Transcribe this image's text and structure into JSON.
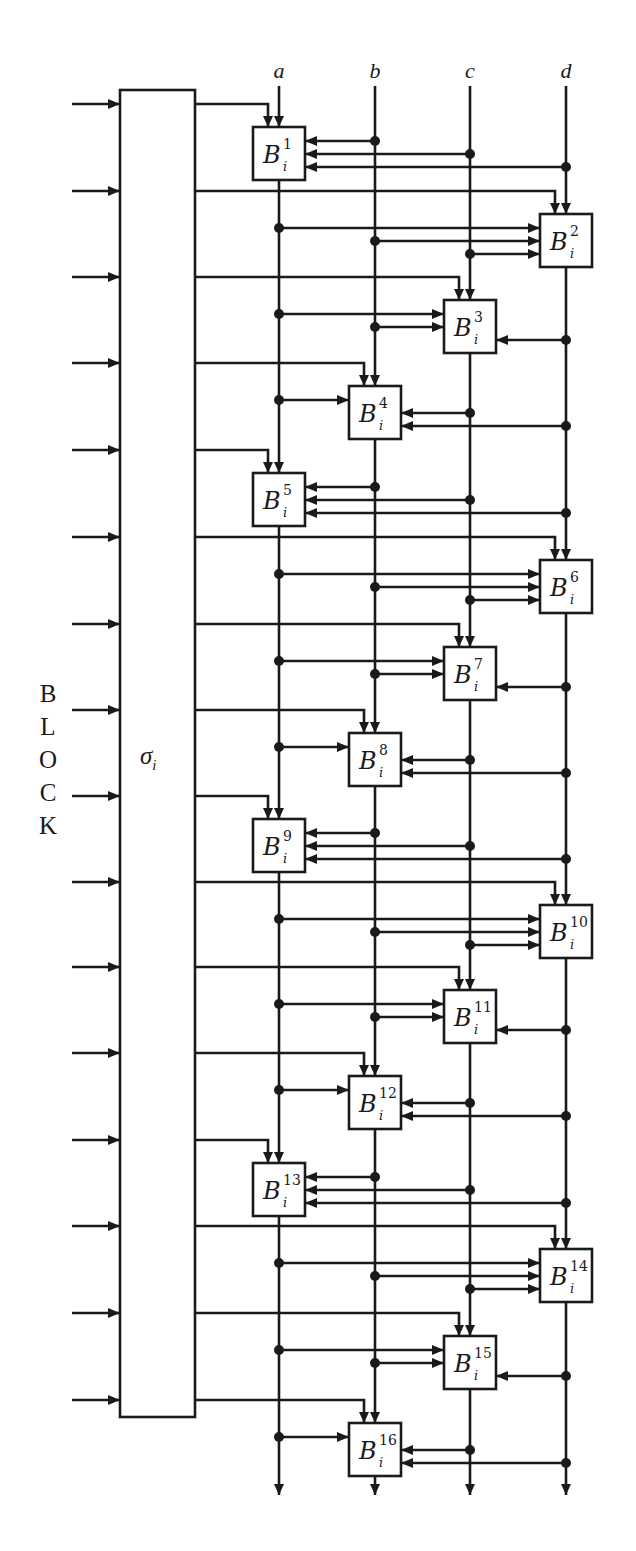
{
  "diagram": {
    "title_labels": {
      "columns": [
        {
          "id": "a",
          "label": "a",
          "x": 279
        },
        {
          "id": "b",
          "label": "b",
          "x": 375
        },
        {
          "id": "c",
          "label": "c",
          "x": 470
        },
        {
          "id": "d",
          "label": "d",
          "x": 566
        }
      ]
    },
    "side_label": {
      "letters": [
        "B",
        "L",
        "O",
        "C",
        "K"
      ],
      "y": [
        681,
        714,
        747,
        780,
        813
      ]
    },
    "permutation_box": {
      "label": "σ",
      "subscript": "i",
      "x": 120,
      "y": 90,
      "width": 75,
      "height": 1327
    },
    "block_base": "B",
    "block_sub": "i",
    "blocks": [
      {
        "n": "1",
        "col": "a",
        "top": 127
      },
      {
        "n": "2",
        "col": "d",
        "top": 214
      },
      {
        "n": "3",
        "col": "c",
        "top": 300
      },
      {
        "n": "4",
        "col": "b",
        "top": 386
      },
      {
        "n": "5",
        "col": "a",
        "top": 473
      },
      {
        "n": "6",
        "col": "d",
        "top": 560
      },
      {
        "n": "7",
        "col": "c",
        "top": 647
      },
      {
        "n": "8",
        "col": "b",
        "top": 733
      },
      {
        "n": "9",
        "col": "a",
        "top": 819
      },
      {
        "n": "10",
        "col": "d",
        "top": 905
      },
      {
        "n": "11",
        "col": "c",
        "top": 990
      },
      {
        "n": "12",
        "col": "b",
        "top": 1076
      },
      {
        "n": "13",
        "col": "a",
        "top": 1163
      },
      {
        "n": "14",
        "col": "d",
        "top": 1249
      },
      {
        "n": "15",
        "col": "c",
        "top": 1336
      },
      {
        "n": "16",
        "col": "b",
        "top": 1423
      }
    ],
    "geometry": {
      "block_w": 52,
      "block_h": 53,
      "line_top": 86,
      "line_bottom": 1495,
      "input_x0": 72,
      "key_offset": 23,
      "side_offsets": [
        14,
        27,
        40
      ]
    },
    "colors": {
      "ink": "#1a1a1a",
      "background": "#ffffff"
    }
  }
}
